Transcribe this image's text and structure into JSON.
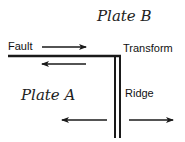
{
  "diagram": {
    "plates": [
      {
        "id": "plate-b",
        "label": "Plate B"
      },
      {
        "id": "plate-a",
        "label": "Plate A"
      }
    ],
    "labels": {
      "fault": "Fault",
      "transform": "Transform",
      "ridge": "Ridge"
    },
    "colors": {
      "line": "#1a1a1a",
      "background": "#ffffff"
    },
    "arrows": [
      {
        "id": "fault-upper",
        "direction": "right"
      },
      {
        "id": "fault-lower",
        "direction": "left"
      },
      {
        "id": "ridge-left",
        "direction": "left"
      },
      {
        "id": "ridge-right",
        "direction": "right"
      }
    ]
  }
}
